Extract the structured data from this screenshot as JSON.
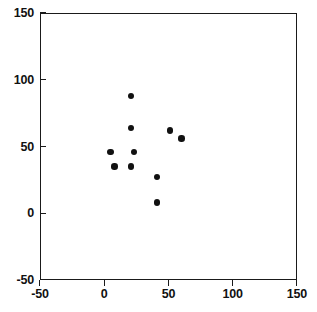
{
  "chart_data": {
    "type": "scatter",
    "title": "",
    "subtitle": "",
    "xlabel": "",
    "ylabel": "",
    "xlim": [
      -50,
      150
    ],
    "ylim": [
      -50,
      150
    ],
    "xticks": [
      -50,
      0,
      50,
      100,
      150
    ],
    "yticks": [
      -50,
      0,
      50,
      100,
      150
    ],
    "xtick_labels": [
      "-50",
      "0",
      "50",
      "100",
      "150"
    ],
    "ytick_labels": [
      "-50",
      "0",
      "50",
      "100",
      "150"
    ],
    "grid": false,
    "legend": null,
    "legend_position": "none",
    "marker": "filled-circle",
    "marker_color": "#111111",
    "series": [
      {
        "name": "data",
        "points": [
          {
            "x": 21,
            "y": 88
          },
          {
            "x": 21,
            "y": 64
          },
          {
            "x": 51,
            "y": 62
          },
          {
            "x": 60,
            "y": 56
          },
          {
            "x": 5,
            "y": 46
          },
          {
            "x": 23,
            "y": 46
          },
          {
            "x": 8,
            "y": 35
          },
          {
            "x": 21,
            "y": 35
          },
          {
            "x": 41,
            "y": 27
          },
          {
            "x": 41,
            "y": 8
          }
        ]
      }
    ]
  }
}
